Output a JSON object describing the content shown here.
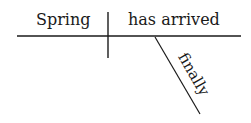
{
  "diagram": {
    "type": "sentence-diagram",
    "subject": "Spring",
    "predicate": "has arrived",
    "modifier": "finally",
    "line_color": "#1a1a1a",
    "text_color": "#1a1a1a"
  }
}
